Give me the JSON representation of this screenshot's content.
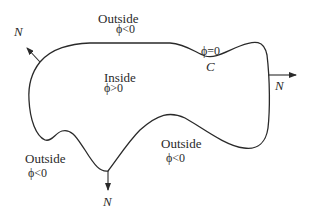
{
  "diagram": {
    "labels": {
      "outside_top": {
        "text": "Outside",
        "phi": "ϕ<0"
      },
      "inside": {
        "text": "Inside",
        "phi": "ϕ>0"
      },
      "outside_bottom_left": {
        "text": "Outside",
        "phi": "ϕ<0"
      },
      "outside_bottom_right": {
        "text": "Outside",
        "phi": "ϕ<0"
      },
      "interface": {
        "phi": "ϕ=0",
        "curve_name": "C"
      },
      "normals": [
        "N",
        "N",
        "N"
      ]
    },
    "colors": {
      "stroke": "#2a2a2a",
      "background": "#ffffff"
    }
  }
}
